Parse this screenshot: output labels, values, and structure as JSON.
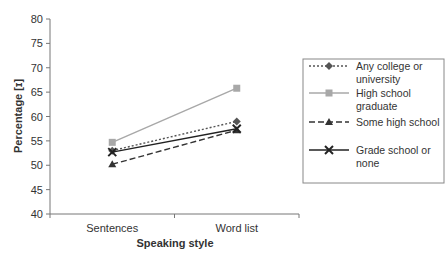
{
  "chart_data": {
    "type": "line",
    "title": "",
    "xlabel": "Speaking style",
    "ylabel": "Percentage [ɪ]",
    "categories": [
      "Sentences",
      "Word list"
    ],
    "ylim": [
      40,
      80
    ],
    "yticks": [
      40,
      45,
      50,
      55,
      60,
      65,
      70,
      75,
      80
    ],
    "grid": false,
    "legend_position": "right",
    "series": [
      {
        "name": "Any college or university",
        "values": [
          53.0,
          59.0
        ],
        "color": "#555555",
        "dash": "2,2",
        "marker": "diamond",
        "legend_lines": [
          "Any college or",
          "university"
        ]
      },
      {
        "name": "High school graduate",
        "values": [
          54.7,
          65.8
        ],
        "color": "#a8a8a8",
        "dash": "",
        "marker": "square",
        "legend_lines": [
          "High school",
          "graduate"
        ]
      },
      {
        "name": "Some high school",
        "values": [
          50.2,
          57.2
        ],
        "color": "#333333",
        "dash": "6,3",
        "marker": "triangle",
        "legend_lines": [
          "Some high school"
        ]
      },
      {
        "name": "Grade school or none",
        "values": [
          52.7,
          57.5
        ],
        "color": "#222222",
        "dash": "",
        "marker": "x",
        "legend_lines": [
          "Grade school or",
          "none"
        ]
      }
    ]
  }
}
